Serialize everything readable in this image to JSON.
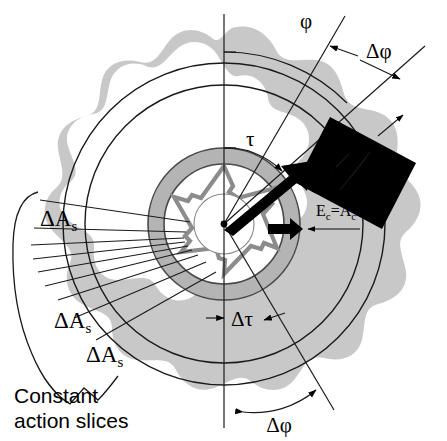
{
  "figure": {
    "background_color": "#ffffff",
    "blob_fill": "#c8c8c8",
    "annulus_fill": "#b4b4b4",
    "line_color": "#000000",
    "slice_fill": "#000000",
    "slice_text_color": "#ffffff"
  },
  "labels": {
    "phi": "φ",
    "delta_phi_top": "Δφ",
    "delta_phi_bottom": "Δφ",
    "tau": "τ",
    "delta_tau": "Δτ",
    "slice_area": "ΔA",
    "slice_area_sub": "s",
    "slice_area_arg": "(φ)",
    "es_main": "E",
    "es_sub": "s",
    "es_arg": "(φ)",
    "ec_main": "E",
    "ec_sub": "c",
    "ec_eq": "=A",
    "ec_sub2": "c",
    "ec_tail": "/Tau",
    "delta_as_1": "ΔA",
    "delta_as_1_sub": "s",
    "delta_as_2": "ΔA",
    "delta_as_2_sub": "s",
    "delta_as_3": "ΔA",
    "delta_as_3_sub": "s",
    "caption_line1": "Constant",
    "caption_line2": "action slices"
  }
}
